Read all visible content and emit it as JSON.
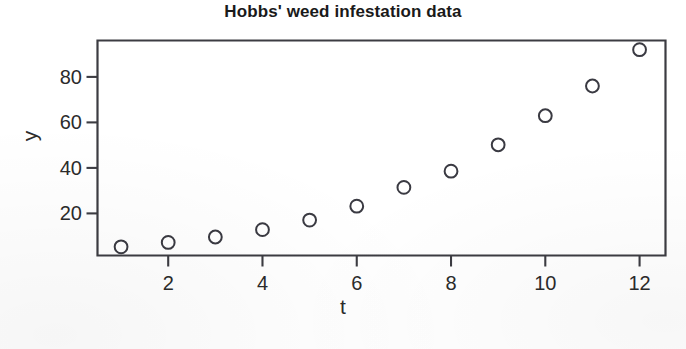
{
  "chart_data": {
    "type": "scatter",
    "title": "Hobbs' weed infestation data",
    "xlabel": "t",
    "ylabel": "y",
    "x": [
      1,
      2,
      3,
      4,
      5,
      6,
      7,
      8,
      9,
      10,
      11,
      12
    ],
    "values": [
      5.308,
      7.24,
      9.638,
      12.866,
      17.069,
      23.192,
      31.443,
      38.558,
      50.156,
      62.948,
      75.995,
      91.972
    ],
    "series": [
      {
        "name": "weed density",
        "values": [
          5.308,
          7.24,
          9.638,
          12.866,
          17.069,
          23.192,
          31.443,
          38.558,
          50.156,
          62.948,
          75.995,
          91.972
        ]
      }
    ],
    "xlim": [
      0.5,
      12.55
    ],
    "ylim": [
      1.5,
      96.0
    ],
    "xticks": [
      2,
      4,
      6,
      8,
      10,
      12
    ],
    "xtick_labels": [
      "2",
      "4",
      "6",
      "8",
      "10",
      "12"
    ],
    "yticks": [
      20,
      40,
      60,
      80
    ],
    "ytick_labels": [
      "20",
      "40",
      "60",
      "80"
    ],
    "grid": false,
    "legend": null,
    "marker": "open-circle",
    "marker_color": "#3a3a42",
    "frame_color": "#3c3c42",
    "background": "#ffffff"
  },
  "axes": {
    "y_ticks": [
      {
        "label": "80",
        "value": 80
      },
      {
        "label": "60",
        "value": 60
      },
      {
        "label": "40",
        "value": 40
      },
      {
        "label": "20",
        "value": 20
      }
    ],
    "x_ticks": [
      {
        "label": "2",
        "value": 2
      },
      {
        "label": "4",
        "value": 4
      },
      {
        "label": "6",
        "value": 6
      },
      {
        "label": "8",
        "value": 8
      },
      {
        "label": "10",
        "value": 10
      },
      {
        "label": "12",
        "value": 12
      }
    ]
  }
}
